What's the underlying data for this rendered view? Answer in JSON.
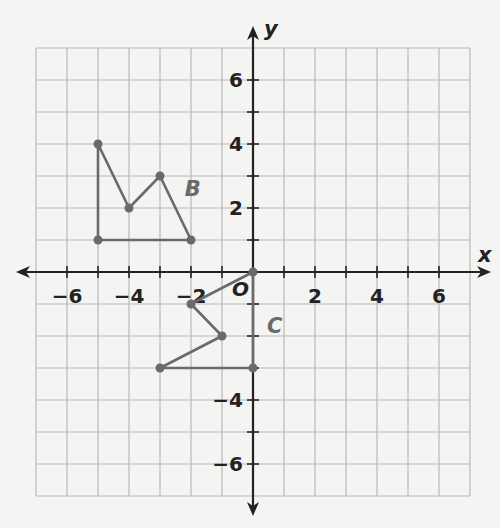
{
  "chart_data": {
    "type": "scatter",
    "title": "",
    "xlabel": "x",
    "ylabel": "y",
    "xlim": [
      -7,
      7
    ],
    "ylim": [
      -7,
      7
    ],
    "grid": true,
    "x_tick_labels": [
      "−6",
      "−4",
      "−2",
      "2",
      "4",
      "6"
    ],
    "x_tick_values": [
      -6,
      -4,
      -2,
      2,
      4,
      6
    ],
    "y_tick_labels": [
      "6",
      "4",
      "2",
      "−4",
      "−6"
    ],
    "y_tick_values": [
      6,
      4,
      2,
      -4,
      -6
    ],
    "origin_label": "O",
    "series": [
      {
        "name": "B",
        "kind": "polygon",
        "points": [
          [
            -5,
            4
          ],
          [
            -4,
            2
          ],
          [
            -3,
            3
          ],
          [
            -2,
            1
          ],
          [
            -5,
            1
          ]
        ],
        "label_position": [
          -2.2,
          2.6
        ]
      },
      {
        "name": "C",
        "kind": "polygon",
        "points": [
          [
            0,
            0
          ],
          [
            -2,
            -1
          ],
          [
            -1,
            -2
          ],
          [
            -3,
            -3
          ],
          [
            0,
            -3
          ]
        ],
        "label_position": [
          0.45,
          -1.7
        ]
      }
    ]
  },
  "axes": {
    "x_label": "x",
    "y_label": "y",
    "origin": "O"
  },
  "shapes": {
    "b_label": "B",
    "c_label": "C"
  },
  "colors": {
    "axis": "#222222",
    "grid": "#b8b8b8",
    "shape": "#6a6a6a"
  }
}
